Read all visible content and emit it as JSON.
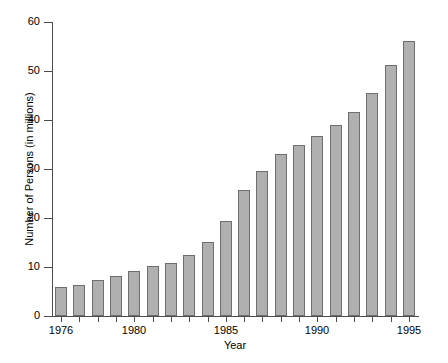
{
  "chart_data": {
    "type": "bar",
    "title": "",
    "xlabel": "Year",
    "ylabel": "Number of Persons (in millions)",
    "categories": [
      1976,
      1977,
      1978,
      1979,
      1980,
      1981,
      1982,
      1983,
      1984,
      1985,
      1986,
      1987,
      1988,
      1989,
      1990,
      1991,
      1992,
      1993,
      1994,
      1995
    ],
    "values": [
      6.0,
      6.3,
      7.4,
      8.2,
      9.1,
      10.2,
      10.8,
      12.4,
      15.2,
      19.3,
      25.8,
      29.6,
      33.0,
      35.0,
      36.8,
      39.0,
      41.7,
      45.5,
      51.3,
      56.2
    ],
    "ylim": [
      0,
      60
    ],
    "ytick_values": [
      0,
      10,
      20,
      30,
      40,
      50,
      60
    ],
    "ytick_labels": [
      "0",
      "10",
      "20",
      "30",
      "40",
      "50",
      "60"
    ],
    "xtick_values": [
      1976,
      1980,
      1985,
      1990,
      1995
    ],
    "xtick_labels": [
      "1976",
      "1980",
      "1985",
      "1990",
      "1995"
    ],
    "grid": false,
    "legend": null,
    "bar_color": "#b0b0b0",
    "bar_edge_color": "#6e6e6e",
    "axis_color": "#4d4d4d",
    "background_color": "#ffffff"
  }
}
